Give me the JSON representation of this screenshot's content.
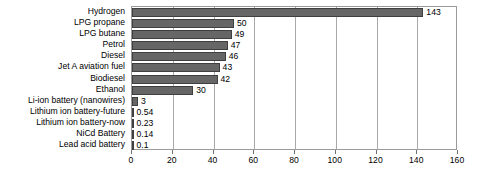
{
  "chart_data": {
    "type": "bar",
    "orientation": "horizontal",
    "title": "",
    "subtitle": "",
    "xlabel": "",
    "ylabel": "",
    "xlim": [
      0,
      160
    ],
    "xticks": [
      0,
      20,
      40,
      60,
      80,
      100,
      120,
      140,
      160
    ],
    "xtick_labels": [
      "0",
      "20",
      "40",
      "60",
      "80",
      "100",
      "120",
      "140",
      "160"
    ],
    "grid": true,
    "grid_axis": "x",
    "legend": false,
    "legend_position": "none",
    "bar_color": "#666666",
    "bar_edge_color": "#3f3f3f",
    "plot_border_color": "#9a9a9a",
    "gridline_color": "#a8a8a8",
    "background": "#ffffff",
    "categories": [
      "Hydrogen",
      "LPG propane",
      "LPG butane",
      "Petrol",
      "Diesel",
      "Jet A aviation fuel",
      "Biodiesel",
      "Ethanol",
      "Li-ion battery (nanowires)",
      "Lithium ion battery-future",
      "Lithium ion battery-now",
      "NiCd Battery",
      "Lead acid battery"
    ],
    "values": [
      143,
      50,
      49,
      47,
      46,
      43,
      42,
      30,
      3,
      0.54,
      0.23,
      0.14,
      0.1
    ],
    "value_labels": [
      "143",
      "50",
      "49",
      "47",
      "46",
      "43",
      "42",
      "30",
      "3",
      "0.54",
      "0.23",
      "0.14",
      "0.1"
    ]
  }
}
